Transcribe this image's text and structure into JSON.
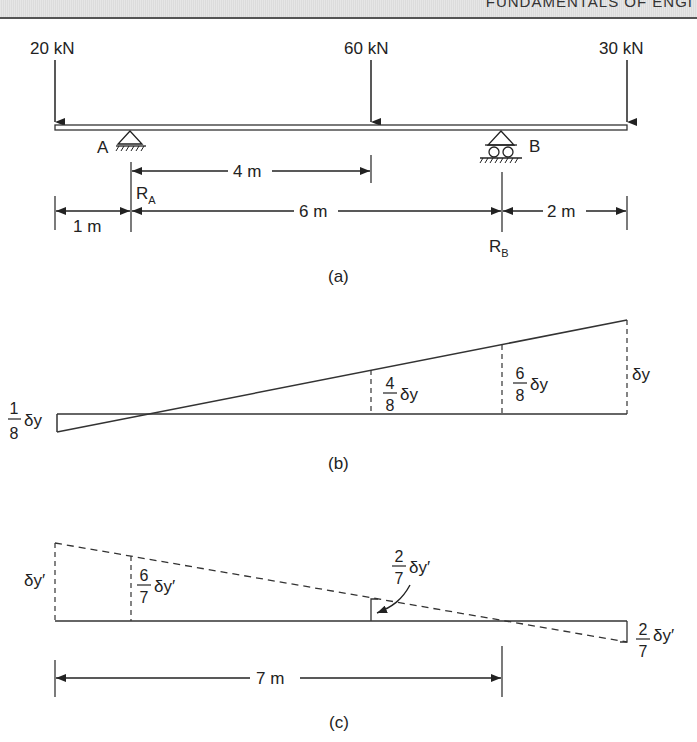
{
  "header": {
    "title": "FUNDAMENTALS OF ENGI"
  },
  "figure_a": {
    "caption": "(a)",
    "loads": [
      {
        "label": "20 kN",
        "position_m": 0
      },
      {
        "label": "60 kN",
        "position_m": 5
      },
      {
        "label": "30 kN",
        "position_m": 9
      }
    ],
    "supports": [
      {
        "label": "A",
        "type": "pin",
        "position_m": 1,
        "reaction": "R",
        "reaction_sub": "A"
      },
      {
        "label": "B",
        "type": "roller",
        "position_m": 7,
        "reaction": "R",
        "reaction_sub": "B"
      }
    ],
    "dimensions": {
      "d1": "1 m",
      "d6": "6 m",
      "d2": "2 m",
      "d4": "4 m"
    }
  },
  "figure_b": {
    "caption": "(b)",
    "labels": {
      "left_num": "1",
      "left_den": "8",
      "left_sym": "δy",
      "mid_num": "4",
      "mid_den": "8",
      "mid_sym": "δy",
      "b_num": "6",
      "b_den": "8",
      "b_sym": "δy",
      "right_sym": "δy"
    }
  },
  "figure_c": {
    "caption": "(c)",
    "labels": {
      "left_sym": "δy′",
      "a_num": "6",
      "a_den": "7",
      "a_sym": "δy′",
      "mid_num": "2",
      "mid_den": "7",
      "mid_sym": "δy′",
      "right_num": "2",
      "right_den": "7",
      "right_sym": "δy′"
    },
    "dimension": "7 m"
  }
}
